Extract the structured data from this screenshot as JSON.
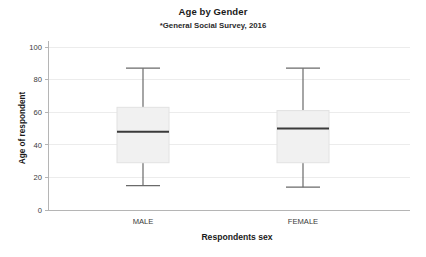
{
  "chart_data": {
    "type": "box",
    "title": "Age by Gender",
    "subtitle": "*General Social Survey, 2016",
    "xlabel": "Respondents sex",
    "ylabel": "Age of respondent",
    "categories": [
      "MALE",
      "FEMALE"
    ],
    "ylim": [
      0,
      105
    ],
    "yticks": [
      0,
      20,
      40,
      60,
      80,
      100
    ],
    "ytick_labels": [
      "0",
      "20",
      "40",
      "60",
      "80",
      "100"
    ],
    "grid": true,
    "grid_axis": "y",
    "legend": "none",
    "box_fill": "#f1f1f1",
    "box_edge": "#e2e2e2",
    "median_color": "#3a3a3a",
    "whisker_color": "#6a6a6a",
    "axis_color": "#b5b5b5",
    "grid_color": "#ececec",
    "boxes": [
      {
        "category": "MALE",
        "whisker_low": 15,
        "q1": 29,
        "median": 48,
        "q3": 63,
        "whisker_high": 87
      },
      {
        "category": "FEMALE",
        "whisker_low": 14,
        "q1": 29,
        "median": 50,
        "q3": 61,
        "whisker_high": 87
      }
    ]
  }
}
